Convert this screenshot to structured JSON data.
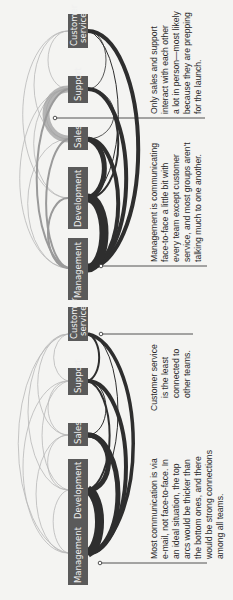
{
  "figure": {
    "panels": [
      {
        "id": "face-to-face",
        "teams": [
          {
            "label": "Customer service",
            "line1": "Customer",
            "line2": "service"
          },
          {
            "label": "Support"
          },
          {
            "label": "Sales"
          },
          {
            "label": "Development"
          },
          {
            "label": "Management"
          }
        ],
        "annotations": {
          "sales_support": [
            "Only sales and support",
            "interact with each other",
            "a lot in person—most likely",
            "because they are prepping",
            "for the launch."
          ],
          "management": [
            "Management is communicating",
            "face-to-face a little bit with",
            "every team except customer",
            "service, and most groups aren't",
            "talking much to one another."
          ]
        }
      },
      {
        "id": "email",
        "teams": [
          {
            "label": "Customer service",
            "line1": "Customer",
            "line2": "service"
          },
          {
            "label": "Support"
          },
          {
            "label": "Sales"
          },
          {
            "label": "Development"
          },
          {
            "label": "Management"
          }
        ],
        "annotations": {
          "customer_service": [
            "Customer service",
            "is the least",
            "connected to",
            "other teams."
          ],
          "overall": [
            "Most communication is via",
            "e-mail, not face-to-face. In",
            "an ideal situation, the top",
            "arcs would be thicker than",
            "the bottom ones, and there",
            "would be strong connections",
            "among all teams."
          ]
        }
      }
    ],
    "colors": {
      "label_bg": "#5a5a5a",
      "arc_light": "#b4b4b4",
      "arc_dark": "#2e2e2e",
      "highlight": "#a8a8a8"
    }
  }
}
